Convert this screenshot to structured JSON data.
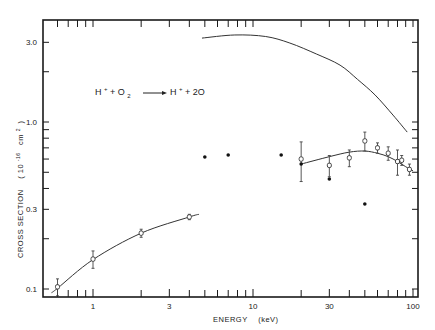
{
  "chart_data": {
    "type": "scatter",
    "title": "",
    "annotation": "H+ + O2 → H+ + 2O",
    "xlabel": "ENERGY (keV)",
    "ylabel": "CROSS SECTION (10^-16 cm^2)",
    "xscale": "log",
    "yscale": "log",
    "xlim": [
      0.5,
      110
    ],
    "ylim": [
      0.09,
      4.0
    ],
    "grid": false,
    "legend": "none",
    "x_tick_labels": [
      "1",
      "3",
      "10",
      "30",
      "100"
    ],
    "y_tick_labels": [
      "0.1",
      "0.3",
      "1.0",
      "3.0"
    ],
    "series": [
      {
        "name": "low-energy data (open circles)",
        "marker": "open-circle",
        "x": [
          0.6,
          1,
          2,
          4
        ],
        "y": [
          0.103,
          0.151,
          0.216,
          0.27
        ],
        "yerr": [
          0.012,
          0.018,
          0.012,
          0.01
        ]
      },
      {
        "name": "high-energy data (open circles)",
        "marker": "open-circle",
        "x": [
          20,
          30,
          40,
          50,
          60,
          70,
          80,
          85,
          95
        ],
        "y": [
          0.6,
          0.55,
          0.61,
          0.77,
          0.7,
          0.65,
          0.58,
          0.59,
          0.52
        ],
        "yerr": [
          0.16,
          0.08,
          0.07,
          0.1,
          0.05,
          0.06,
          0.1,
          0.04,
          0.04
        ]
      },
      {
        "name": "filled circles",
        "marker": "filled-circle",
        "x": [
          5,
          7,
          15,
          20,
          30,
          50
        ],
        "y": [
          0.617,
          0.634,
          0.634,
          0.56,
          0.456,
          0.323
        ]
      },
      {
        "name": "low-energy fit curve",
        "marker": "line",
        "x": [
          0.55,
          0.6,
          1,
          2,
          4,
          4.6
        ],
        "y": [
          0.095,
          0.101,
          0.15,
          0.216,
          0.27,
          0.28
        ]
      },
      {
        "name": "high-energy fit curve",
        "marker": "line",
        "x": [
          20,
          30,
          40,
          50,
          60,
          70,
          80,
          90,
          100
        ],
        "y": [
          0.56,
          0.62,
          0.66,
          0.67,
          0.65,
          0.62,
          0.58,
          0.54,
          0.51
        ]
      },
      {
        "name": "upper theory curve",
        "marker": "line",
        "x": [
          4.8,
          7.7,
          12,
          17,
          25,
          35,
          45,
          58,
          75,
          92
        ],
        "y": [
          3.18,
          3.32,
          3.25,
          2.97,
          2.55,
          2.19,
          1.8,
          1.45,
          1.1,
          0.87
        ]
      }
    ]
  },
  "labels": {
    "xlabel_text": "ENERGY",
    "xlabel_unit": "(keV)",
    "ylabel_text": "CROSS SECTION",
    "ylabel_unit": "( 10",
    "ylabel_exp": "-16",
    "ylabel_unit2": "cm",
    "ylabel_exp2": "2",
    "ylabel_close": ")"
  },
  "annotation_parts": {
    "h1": "H",
    "plus_sup": "+",
    "plus_o": "+ O",
    "sub2": "2",
    "h2": "H",
    "plus_sup2": "+",
    "rest": "+ 2O"
  }
}
